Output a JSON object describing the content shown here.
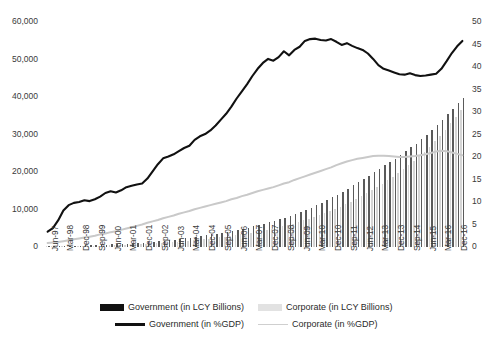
{
  "chart_data": {
    "type": "bar",
    "title": "",
    "subtitle": "",
    "xlabel": "",
    "ylabel": "",
    "y_left": {
      "label": "in LCY Billions",
      "ticks": [
        "0",
        "10,000",
        "20,000",
        "30,000",
        "40,000",
        "50,000",
        "60,000"
      ],
      "tick_values": [
        0,
        10000,
        20000,
        30000,
        40000,
        50000,
        60000
      ],
      "ylim": [
        0,
        60000
      ]
    },
    "y_right": {
      "label": "in %GDP",
      "ticks": [
        "0",
        "5",
        "10",
        "15",
        "20",
        "25",
        "30",
        "35",
        "40",
        "45",
        "50"
      ],
      "tick_values": [
        0,
        5,
        10,
        15,
        20,
        25,
        30,
        35,
        40,
        45,
        50
      ],
      "ylim": [
        0,
        50
      ]
    },
    "grid": false,
    "legend_position": "bottom",
    "categories": [
      "Jun-97",
      "Sep-97",
      "Dec-97",
      "Mar-98",
      "Jun-98",
      "Sep-98",
      "Dec-98",
      "Mar-99",
      "Jun-99",
      "Sep-99",
      "Dec-99",
      "Mar-00",
      "Jun-00",
      "Sep-00",
      "Dec-00",
      "Mar-01",
      "Jun-01",
      "Sep-01",
      "Dec-01",
      "Mar-02",
      "Jun-02",
      "Sep-02",
      "Dec-02",
      "Mar-03",
      "Jun-03",
      "Sep-03",
      "Dec-03",
      "Mar-04",
      "Jun-04",
      "Sep-04",
      "Dec-04",
      "Mar-05",
      "Jun-05",
      "Sep-05",
      "Dec-05",
      "Mar-06",
      "Jun-06",
      "Sep-06",
      "Dec-06",
      "Mar-07",
      "Jun-07",
      "Sep-07",
      "Dec-07",
      "Mar-08",
      "Jun-08",
      "Sep-08",
      "Dec-08",
      "Mar-09",
      "Jun-09",
      "Sep-09",
      "Dec-09",
      "Mar-10",
      "Jun-10",
      "Sep-10",
      "Dec-10",
      "Mar-11",
      "Jun-11",
      "Sep-11",
      "Dec-11",
      "Mar-12",
      "Jun-12",
      "Sep-12",
      "Dec-12",
      "Mar-13",
      "Jun-13",
      "Sep-13",
      "Dec-13",
      "Mar-14",
      "Jun-14",
      "Sep-14",
      "Dec-14",
      "Mar-15",
      "Jun-15",
      "Sep-15",
      "Dec-15",
      "Mar-16",
      "Jun-16",
      "Sep-16",
      "Dec-16",
      "Mar-17"
    ],
    "x_tick_labels_shown": [
      "Jun-97",
      "Mar-98",
      "Dec-98",
      "Sep-99",
      "Jun-00",
      "Mar-01",
      "Dec-01",
      "Sep-02",
      "Jun-03",
      "Mar-04",
      "Dec-04",
      "Sep-05",
      "Jun-06",
      "Mar-07",
      "Dec-07",
      "Sep-08",
      "Jun-09",
      "Mar-10",
      "Dec-10",
      "Sep-11",
      "Jun-12",
      "Mar-13",
      "Dec-13",
      "Sep-14",
      "Jun-15",
      "Mar-16",
      "Dec-16"
    ],
    "series": [
      {
        "name": "Government (in LCY Billions)",
        "type": "bar",
        "axis": "left",
        "color": "#5a5a5a",
        "values": [
          180,
          200,
          225,
          255,
          300,
          340,
          380,
          430,
          470,
          520,
          570,
          620,
          680,
          740,
          810,
          880,
          960,
          1040,
          1140,
          1250,
          1360,
          1480,
          1620,
          1780,
          1950,
          2120,
          2300,
          2500,
          2700,
          2900,
          3120,
          3350,
          3580,
          3820,
          4080,
          4350,
          4620,
          4900,
          5200,
          5520,
          5850,
          6200,
          6560,
          6950,
          7350,
          7780,
          8250,
          8750,
          9280,
          9850,
          10450,
          11100,
          11800,
          12500,
          13250,
          14000,
          14800,
          15600,
          16450,
          17300,
          18150,
          19000,
          19900,
          20850,
          21750,
          22650,
          23600,
          24600,
          25600,
          26600,
          27600,
          28700,
          29900,
          31200,
          32500,
          33900,
          35400,
          36900,
          38400,
          39800
        ]
      },
      {
        "name": "Corporate (in LCY Billions)",
        "type": "bar",
        "axis": "left",
        "color": "#d5d5d5",
        "values": [
          140,
          155,
          170,
          190,
          215,
          240,
          265,
          295,
          325,
          355,
          390,
          425,
          465,
          505,
          550,
          600,
          655,
          710,
          775,
          845,
          920,
          1000,
          1090,
          1190,
          1300,
          1415,
          1540,
          1670,
          1810,
          1950,
          2100,
          2260,
          2420,
          2590,
          2770,
          2960,
          3160,
          3370,
          3590,
          3830,
          4080,
          4340,
          4620,
          4910,
          5220,
          5550,
          5900,
          6270,
          6670,
          7090,
          7540,
          8010,
          8510,
          9040,
          9600,
          10180,
          10800,
          11450,
          12120,
          12820,
          13550,
          14320,
          15120,
          15960,
          16840,
          17760,
          18720,
          19720,
          20770,
          21860,
          23000,
          24200,
          25450,
          26800,
          28200,
          29700,
          31300,
          33000,
          34800,
          36600
        ]
      },
      {
        "name": "Government (in %GDP)",
        "type": "line",
        "axis": "right",
        "color": "#111111",
        "values": [
          3.4,
          4.2,
          5.9,
          8.1,
          9.3,
          9.8,
          10.0,
          10.4,
          10.2,
          10.6,
          11.2,
          12.0,
          12.4,
          12.1,
          12.6,
          13.3,
          13.6,
          13.9,
          14.1,
          15.2,
          16.8,
          18.4,
          19.7,
          20.1,
          20.6,
          21.3,
          22.0,
          22.5,
          23.8,
          24.6,
          25.1,
          25.9,
          27.0,
          28.3,
          29.6,
          31.2,
          33.0,
          34.6,
          36.2,
          38.0,
          39.6,
          40.9,
          41.8,
          41.4,
          42.2,
          43.5,
          42.6,
          43.8,
          44.5,
          45.8,
          46.2,
          46.3,
          46.0,
          45.9,
          46.2,
          45.6,
          44.9,
          45.3,
          44.7,
          44.2,
          43.8,
          43.0,
          41.8,
          40.4,
          39.6,
          39.2,
          38.8,
          38.4,
          38.3,
          38.6,
          38.2,
          38.0,
          38.1,
          38.3,
          38.5,
          39.6,
          41.3,
          43.1,
          44.6,
          45.8
        ],
        "line_values_tail": [
          45.5,
          45.2,
          45.6,
          46.8,
          47.2
        ]
      },
      {
        "name": "Corporate (in %GDP)",
        "type": "line",
        "axis": "right",
        "color": "#c9c9c9",
        "values": [
          0.9,
          1.0,
          1.1,
          1.3,
          1.5,
          1.7,
          1.9,
          2.1,
          2.3,
          2.5,
          2.8,
          3.0,
          3.3,
          3.5,
          3.8,
          4.1,
          4.4,
          4.7,
          5.0,
          5.4,
          5.7,
          6.0,
          6.4,
          6.7,
          7.0,
          7.4,
          7.7,
          8.0,
          8.4,
          8.7,
          9.0,
          9.3,
          9.6,
          9.9,
          10.2,
          10.6,
          10.9,
          11.3,
          11.6,
          12.0,
          12.4,
          12.7,
          13.0,
          13.3,
          13.7,
          14.1,
          14.4,
          14.9,
          15.3,
          15.7,
          16.1,
          16.5,
          16.9,
          17.3,
          17.7,
          18.2,
          18.6,
          19.0,
          19.3,
          19.6,
          19.8,
          20.0,
          20.2,
          20.3,
          20.3,
          20.2,
          20.1,
          20.0,
          20.0,
          20.1,
          20.2,
          20.4,
          20.6,
          20.9,
          21.2,
          21.4,
          21.3,
          21.0,
          20.7,
          20.4
        ]
      }
    ],
    "legend": [
      {
        "label": "Government (in LCY Billions)",
        "marker": "bar",
        "color": "#111111"
      },
      {
        "label": "Corporate (in LCY Billions)",
        "marker": "bar",
        "color": "#e2e2e2"
      },
      {
        "label": "Government (in %GDP)",
        "marker": "line",
        "color": "#111111"
      },
      {
        "label": "Corporate (in %GDP)",
        "marker": "line",
        "color": "#cfcfcf"
      }
    ]
  }
}
